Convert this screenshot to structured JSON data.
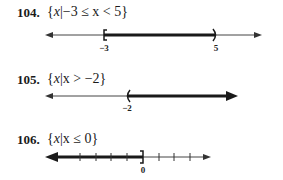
{
  "problems": [
    {
      "number": "104.",
      "set_open": "{",
      "var": "x",
      "bar": "|",
      "condition": "−3 ≤ x < 5",
      "set_close": "}",
      "number_line": {
        "left_endpoint": {
          "value": "−3",
          "type": "closed-bracket"
        },
        "right_endpoint": {
          "value": "5",
          "type": "open-paren"
        },
        "shaded": "between"
      }
    },
    {
      "number": "105.",
      "set_open": "{",
      "var": "x",
      "bar": "|",
      "condition": "x > −2",
      "set_close": "}",
      "number_line": {
        "left_endpoint": {
          "value": "−2",
          "type": "open-paren"
        },
        "shaded": "right"
      }
    },
    {
      "number": "106.",
      "set_open": "{",
      "var": "x",
      "bar": "|",
      "condition": "x ≤ 0",
      "set_close": "}",
      "number_line": {
        "right_endpoint": {
          "value": "0",
          "type": "closed-bracket"
        },
        "shaded": "left",
        "tick_count": 8
      }
    }
  ],
  "colors": {
    "ink": "#1a1a1a",
    "thin_line": "#444444"
  }
}
